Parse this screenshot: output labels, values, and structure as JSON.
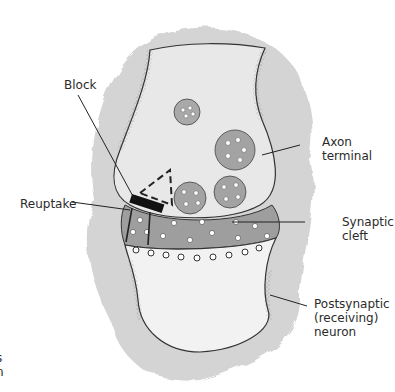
{
  "figure": {
    "labels": {
      "block": "Block",
      "reuptake": "Reuptake",
      "axon_terminal": [
        "Axon",
        "terminal"
      ],
      "synaptic_cleft": [
        "Synaptic",
        "cleft"
      ],
      "postsynaptic": [
        "Postsynaptic",
        "(receiving)",
        "neuron"
      ],
      "cutoff_left": [
        "s",
        "n"
      ]
    },
    "colors": {
      "tissue": "#d6d6d6",
      "terminal_fill": "#e9e9e9",
      "cleft": "#9a9a9a",
      "vesicle": "#a8a8a8",
      "outline": "#333333",
      "block": "#111111"
    }
  }
}
